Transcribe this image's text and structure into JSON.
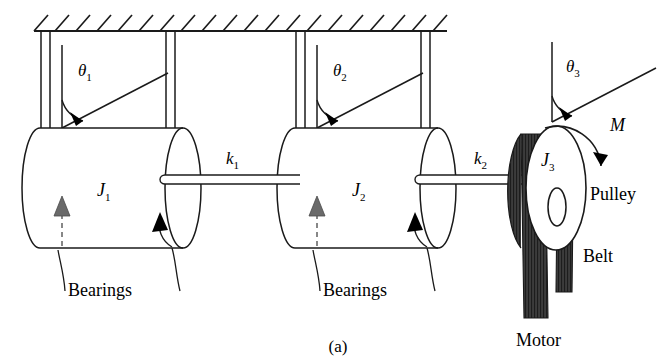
{
  "figure": {
    "caption": "(a)"
  },
  "labels": {
    "theta1": "θ",
    "theta1_sub": "1",
    "theta2": "θ",
    "theta2_sub": "2",
    "theta3": "θ",
    "theta3_sub": "3",
    "inertia1": "J",
    "inertia1_sub": "1",
    "inertia2": "J",
    "inertia2_sub": "2",
    "inertia3": "J",
    "inertia3_sub": "3",
    "stiffness1": "k",
    "stiffness1_sub": "1",
    "stiffness2": "k",
    "stiffness2_sub": "2",
    "moment": "M",
    "pulley": "Pulley",
    "belt": "Belt",
    "motor": "Motor",
    "bearings_left": "Bearings",
    "bearings_right": "Bearings"
  },
  "colors": {
    "line": "#1a1a1a",
    "belt_fill": "#3a3a3a",
    "arrow_fill": "#000000",
    "background": "#ffffff"
  },
  "components": {
    "ceiling": {
      "name": "fixed-support",
      "hatch_count": 20
    },
    "rotors": [
      {
        "name": "J1",
        "label": "J₁"
      },
      {
        "name": "J2",
        "label": "J₂"
      },
      {
        "name": "J3",
        "label": "J₃"
      }
    ],
    "shafts": [
      {
        "name": "k1",
        "label": "k₁"
      },
      {
        "name": "k2",
        "label": "k₂"
      }
    ]
  }
}
